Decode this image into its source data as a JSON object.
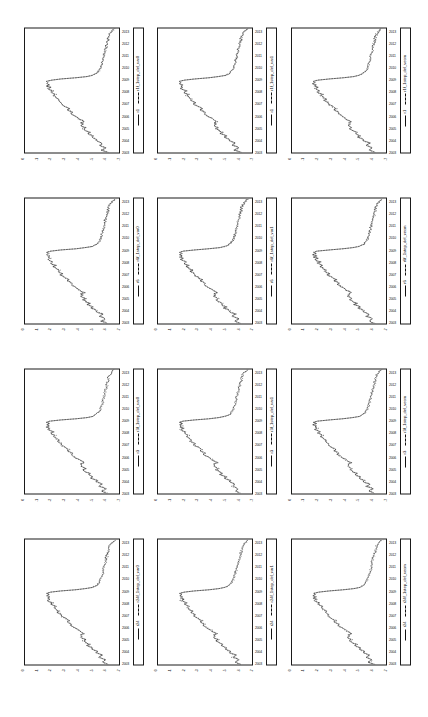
{
  "figure": {
    "orientation": "landscape-rotated-90ccw",
    "background_color": "#ffffff",
    "line_color": "#111111",
    "rows": 3,
    "columns": 4,
    "panel_count": 12
  },
  "axis": {
    "x_ticks": [
      "2003",
      "2004",
      "2005",
      "2006",
      "2007",
      "2008",
      "2009",
      "2010",
      "2011",
      "2012",
      "2013"
    ],
    "y_ticks": [
      "0",
      "-1",
      "-2",
      "-3",
      "-4",
      "-5",
      "-6",
      "-7"
    ],
    "x_label": "",
    "y_label": ""
  },
  "panels": [
    {
      "id": "panel-r24-var0",
      "row": 0,
      "col": 0,
      "series_actual": "r24",
      "series_forecast": "r24f_1step_del_var0"
    },
    {
      "id": "panel-r3-var0",
      "row": 0,
      "col": 1,
      "series_actual": "r3",
      "series_forecast": "r3f_1step_del_var0"
    },
    {
      "id": "panel-r6-var0",
      "row": 0,
      "col": 2,
      "series_actual": "r6",
      "series_forecast": "r6f_1step_del_var0"
    },
    {
      "id": "panel-r1-var0",
      "row": 0,
      "col": 3,
      "series_actual": "r1",
      "series_forecast": "r1f_1step_del_var0"
    },
    {
      "id": "panel-r24-var1",
      "row": 1,
      "col": 0,
      "series_actual": "r24",
      "series_forecast": "r24f_1step_del_var1"
    },
    {
      "id": "panel-r3-var1",
      "row": 1,
      "col": 1,
      "series_actual": "r3",
      "series_forecast": "r3f_1step_del_var1"
    },
    {
      "id": "panel-r6-var1",
      "row": 1,
      "col": 2,
      "series_actual": "r6",
      "series_forecast": "r6f_1step_del_var1"
    },
    {
      "id": "panel-r1-var1",
      "row": 1,
      "col": 3,
      "series_actual": "r1",
      "series_forecast": "r1f_1step_del_var1"
    },
    {
      "id": "panel-r24-vecm",
      "row": 2,
      "col": 0,
      "series_actual": "r24",
      "series_forecast": "r24f_1step_del_vecm"
    },
    {
      "id": "panel-r3-vecm",
      "row": 2,
      "col": 1,
      "series_actual": "r3",
      "series_forecast": "r3f_1step_del_vecm"
    },
    {
      "id": "panel-r6-vecm",
      "row": 2,
      "col": 2,
      "series_actual": "r6",
      "series_forecast": "r6f_1step_del_vecm"
    },
    {
      "id": "panel-r1-vecm",
      "row": 2,
      "col": 3,
      "series_actual": "r1",
      "series_forecast": "r1f_1step_del_vecm"
    }
  ],
  "chart_data": {
    "type": "line",
    "title": "",
    "xlabel": "",
    "ylabel": "",
    "xlim": [
      2003.0,
      2013.5
    ],
    "ylim": [
      -7.5,
      0.5
    ],
    "grid": false,
    "legend_position": "below-axes",
    "x": [
      2003.0,
      2003.1,
      2003.2,
      2003.3,
      2003.4,
      2003.5,
      2003.6,
      2003.7,
      2003.8,
      2003.9,
      2004.0,
      2004.1,
      2004.2,
      2004.3,
      2004.4,
      2004.5,
      2004.6,
      2004.7,
      2004.8,
      2004.9,
      2005.0,
      2005.1,
      2005.2,
      2005.3,
      2005.4,
      2005.5,
      2005.6,
      2005.7,
      2005.8,
      2005.9,
      2006.0,
      2006.1,
      2006.2,
      2006.3,
      2006.4,
      2006.5,
      2006.6,
      2006.7,
      2006.8,
      2006.9,
      2007.0,
      2007.1,
      2007.2,
      2007.3,
      2007.4,
      2007.5,
      2007.6,
      2007.7,
      2007.8,
      2007.9,
      2008.0,
      2008.1,
      2008.2,
      2008.3,
      2008.4,
      2008.5,
      2008.6,
      2008.7,
      2008.8,
      2008.9,
      2009.0,
      2009.1,
      2009.2,
      2009.3,
      2009.4,
      2009.5,
      2009.6,
      2009.7,
      2009.8,
      2009.9,
      2010.0,
      2010.1,
      2010.2,
      2010.3,
      2010.4,
      2010.5,
      2010.6,
      2010.7,
      2010.8,
      2010.9,
      2011.0,
      2011.1,
      2011.2,
      2011.3,
      2011.4,
      2011.5,
      2011.6,
      2011.7,
      2011.8,
      2011.9,
      2012.0,
      2012.1,
      2012.2,
      2012.3,
      2012.4,
      2012.5,
      2012.6,
      2012.7,
      2012.8,
      2012.9,
      2013.0,
      2013.1,
      2013.2,
      2013.3,
      2013.4,
      2013.5
    ],
    "series": [
      {
        "name": "actual",
        "style": "solid",
        "values": [
          -6.55,
          -6.3,
          -6.05,
          -6.2,
          -6.35,
          -6.15,
          -5.85,
          -5.95,
          -6.1,
          -5.8,
          -5.5,
          -5.62,
          -5.4,
          -5.15,
          -5.3,
          -5.05,
          -4.85,
          -5.0,
          -4.75,
          -4.6,
          -4.45,
          -4.62,
          -4.4,
          -4.25,
          -4.4,
          -4.3,
          -4.55,
          -4.35,
          -4.15,
          -4.05,
          -3.85,
          -3.7,
          -3.55,
          -3.4,
          -3.5,
          -3.3,
          -3.15,
          -3.25,
          -3.05,
          -2.9,
          -2.7,
          -2.55,
          -2.65,
          -2.45,
          -2.3,
          -2.4,
          -2.2,
          -2.05,
          -1.95,
          -2.1,
          -1.85,
          -1.7,
          -1.9,
          -1.6,
          -1.45,
          -1.65,
          -1.4,
          -1.55,
          -1.3,
          -1.5,
          -1.35,
          -1.7,
          -2.6,
          -3.8,
          -4.7,
          -5.2,
          -5.45,
          -5.6,
          -5.7,
          -5.78,
          -5.85,
          -5.9,
          -5.95,
          -6.0,
          -6.05,
          -6.02,
          -6.08,
          -6.12,
          -6.1,
          -6.15,
          -6.2,
          -6.18,
          -6.25,
          -6.22,
          -6.3,
          -6.28,
          -6.35,
          -6.3,
          -6.38,
          -6.42,
          -6.4,
          -6.48,
          -6.45,
          -6.52,
          -6.5,
          -6.58,
          -6.55,
          -6.62,
          -6.6,
          -6.68,
          -6.7,
          -6.78,
          -6.85,
          -6.95,
          -7.05,
          -7.15
        ]
      },
      {
        "name": "forecast",
        "style": "dashed",
        "values": [
          -6.5,
          -6.33,
          -6.02,
          -6.23,
          -6.31,
          -6.18,
          -5.82,
          -5.98,
          -6.06,
          -5.83,
          -5.47,
          -5.65,
          -5.37,
          -5.18,
          -5.27,
          -5.08,
          -4.82,
          -5.03,
          -4.72,
          -4.63,
          -4.42,
          -4.65,
          -4.37,
          -4.28,
          -4.37,
          -4.33,
          -4.52,
          -4.38,
          -4.12,
          -4.08,
          -3.82,
          -3.73,
          -3.52,
          -3.43,
          -3.47,
          -3.33,
          -3.12,
          -3.28,
          -3.02,
          -2.93,
          -2.67,
          -2.58,
          -2.62,
          -2.48,
          -2.27,
          -2.43,
          -2.17,
          -2.08,
          -1.92,
          -2.13,
          -1.82,
          -1.73,
          -1.87,
          -1.63,
          -1.42,
          -1.68,
          -1.37,
          -1.58,
          -1.27,
          -1.53,
          -1.32,
          -1.67,
          -2.57,
          -3.83,
          -4.67,
          -5.23,
          -5.42,
          -5.63,
          -5.67,
          -5.81,
          -5.82,
          -5.93,
          -5.92,
          -6.03,
          -6.02,
          -6.05,
          -6.05,
          -6.15,
          -6.07,
          -6.18,
          -6.17,
          -6.21,
          -6.22,
          -6.25,
          -6.27,
          -6.31,
          -6.32,
          -6.33,
          -6.35,
          -6.45,
          -6.37,
          -6.51,
          -6.42,
          -6.55,
          -6.47,
          -6.61,
          -6.52,
          -6.65,
          -6.57,
          -6.71,
          -6.67,
          -6.81,
          -6.82,
          -6.98,
          -7.02,
          -7.18
        ]
      }
    ]
  }
}
